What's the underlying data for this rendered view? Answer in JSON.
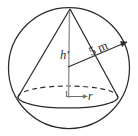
{
  "figure": {
    "name": "cone-inscribed-in-sphere-diagram",
    "background_color": "#ffffff",
    "stroke_color": "#2b2b2b",
    "light_stroke_color": "#8c8c8c",
    "labels": {
      "height": "h′",
      "sphere_radius": "5 m",
      "base_radius": "r"
    },
    "shapes": {
      "sphere": {
        "name": "sphere-outline",
        "center_x": 69,
        "center_y": 68,
        "radius": 61
      },
      "base_ellipse": {
        "name": "cone-base-ellipse",
        "center_x": 68,
        "center_y": 97,
        "rx": 50,
        "ry": 11
      },
      "apex": {
        "x": 70,
        "y": 9
      },
      "base_left": {
        "x": 18,
        "y": 97
      },
      "base_right": {
        "x": 118,
        "y": 97
      },
      "sphere_center": {
        "x": 68,
        "y": 67
      },
      "radius_end": {
        "x": 126,
        "y": 43
      }
    }
  }
}
